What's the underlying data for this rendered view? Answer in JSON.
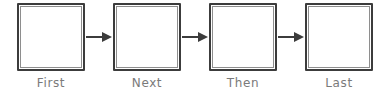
{
  "diagram": {
    "type": "linear-sequence-flow",
    "background_color": "#ffffff",
    "box": {
      "fill_color": "#ffffff",
      "border_color": "#3c3c3c",
      "inner_border_color": "#8e8e8e",
      "width": 68,
      "height": 68
    },
    "label_color": "#7a7a7a",
    "arrow_color": "#3c3c3c",
    "nodes": [
      {
        "label": "First",
        "content": ""
      },
      {
        "label": "Next",
        "content": ""
      },
      {
        "label": "Then",
        "content": ""
      },
      {
        "label": "Last",
        "content": ""
      }
    ],
    "connectors": [
      {
        "from": "First",
        "to": "Next",
        "direction": "right"
      },
      {
        "from": "Next",
        "to": "Then",
        "direction": "right"
      },
      {
        "from": "Then",
        "to": "Last",
        "direction": "right"
      }
    ]
  }
}
